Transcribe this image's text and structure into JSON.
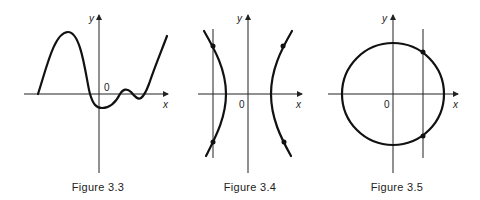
{
  "figures": [
    {
      "caption": "Figure 3.3",
      "axis_labels": {
        "x": "x",
        "y": "y",
        "origin": "0"
      },
      "description": "graph of a function crossing x-axis multiple times"
    },
    {
      "caption": "Figure 3.4",
      "axis_labels": {
        "x": "x",
        "y": "y",
        "origin": "0"
      },
      "description": "hyperbola with a vertical line meeting the left branch at two points"
    },
    {
      "caption": "Figure 3.5",
      "axis_labels": {
        "x": "x",
        "y": "y",
        "origin": "0"
      },
      "description": "circle centered at origin with a vertical line meeting it at two points"
    }
  ],
  "colors": {
    "ink": "#222222",
    "background": "#ffffff"
  }
}
